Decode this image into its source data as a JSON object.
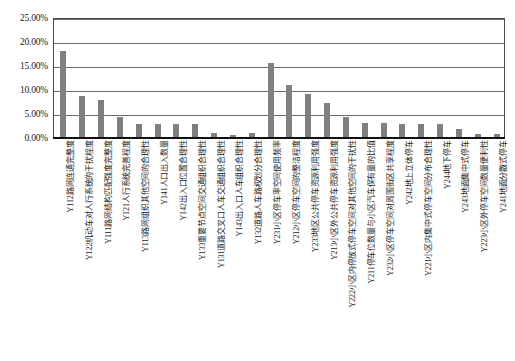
{
  "chart_data": {
    "type": "bar",
    "title": "",
    "xlabel": "",
    "ylabel": "",
    "ylim": [
      0,
      0.25
    ],
    "ytick_labels": [
      "25.00%",
      "20.00%",
      "15.00%",
      "10.00%",
      "5.00%",
      "0.00%"
    ],
    "ytick_values": [
      0.25,
      0.2,
      0.15,
      0.1,
      0.05,
      0.0
    ],
    "grid": true,
    "legend": "none",
    "bar_color": "#808080",
    "axis_color": "#4a4a4a",
    "categories": [
      "Y112路网连通完整度",
      "Y122机动车对人行系统的干扰程度",
      "Y111路网结构匹配强度完整度",
      "Y121人行系统完善程度",
      "Y113路网组织其他空间的合理性",
      "Y141人口出入数量",
      "Y142出入口位置合理性",
      "Y133重要节点空间交通组织合理性",
      "Y131道路交叉口人车交通组织合理性",
      "Y143出入口人车组织合理性",
      "Y132道路人车路权划分合理性",
      "Y231小区停车率空间使用频率",
      "Y212小区停车空间的整洁程度",
      "Y233地区公共停车资源利用强度",
      "Y213小区外公共停车资源利用强度",
      "Y222小区内停放式停车空间对其他空间的干扰性",
      "Y211停车位数量与小区汽车保有量的比值",
      "Y232小区停车空间对周围街区共享程度",
      "Y242地上立体停车",
      "Y221小区内集中式停车空间分布合理性",
      "Y244地下停车",
      "Y243地面集中式停车",
      "Y223小区外停车空间数量便利性",
      "Y241地面分散式停车"
    ],
    "values": [
      0.179,
      0.0855,
      0.077,
      0.0415,
      0.028,
      0.028,
      0.028,
      0.028,
      0.0085,
      0.0038,
      0.0085,
      0.154,
      0.109,
      0.09,
      0.0715,
      0.0425,
      0.03,
      0.03,
      0.028,
      0.028,
      0.028,
      0.0165,
      0.0055,
      0.0055
    ],
    "value_labels": [
      "17.90%",
      "8.55%",
      "7.70%",
      "4.15%",
      "2.80%",
      "2.80%",
      "2.80%",
      "2.80%",
      "0.85%",
      "0.38%",
      "0.85%",
      "15.40%",
      "10.90%",
      "9.00%",
      "7.15%",
      "4.25%",
      "3.00%",
      "3.00%",
      "2.80%",
      "2.80%",
      "2.80%",
      "1.65%",
      "0.55%",
      "0.55%"
    ]
  }
}
